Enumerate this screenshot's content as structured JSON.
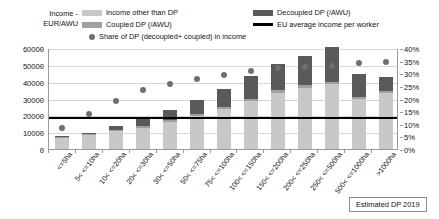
{
  "axis_title": "Income -\nEUR/AWU",
  "axis_title_line1": "Income -",
  "axis_title_line2": "EUR/AWU",
  "legend": {
    "income_other": "Income other than DP",
    "coupled": "Coupled DP (/AWU)",
    "share": "Share of DP (decoupled+ coupled) in income",
    "decoupled": "Decoupled DP (/AWU)",
    "eu_line": "EU average income per worker"
  },
  "colors": {
    "income_other": "#c8c8c8",
    "coupled": "#a0a0a0",
    "decoupled": "#5a5a5a",
    "eu_line": "#000000",
    "dot": "#6f6f6f",
    "grid": "#d6d6d6",
    "axis": "#9a9a9a"
  },
  "note": "Estimated DP 2019",
  "chart_data": {
    "type": "bar",
    "title": "",
    "xlabel": "",
    "ylabel": "Income - EUR/AWU",
    "y2label": "Share of DP in income",
    "ylim": [
      0,
      60000
    ],
    "y2lim": [
      0,
      0.4
    ],
    "grid": true,
    "legend_position": "top",
    "categories": [
      "<=5ha",
      "5< <=10ha",
      "10< <=20ha",
      "20< <=30ha",
      "30< <=50ha",
      "50< <=75ha",
      "75< <=100ha",
      "100< <=150ha",
      "150< <=200ha",
      "200< <=250ha",
      "250< <=500ha",
      "500< <=1000ha",
      ">1000ha"
    ],
    "y_ticks": [
      0,
      10000,
      20000,
      30000,
      40000,
      50000,
      60000
    ],
    "y_tick_labels": [
      "0",
      "10000",
      "20000",
      "30000",
      "40000",
      "50000",
      "60000"
    ],
    "y2_ticks": [
      0,
      5,
      10,
      15,
      20,
      25,
      30,
      35,
      40
    ],
    "y2_tick_labels": [
      "0%",
      "5%",
      "10%",
      "15%",
      "20%",
      "25%",
      "30%",
      "35%",
      "40%"
    ],
    "series": [
      {
        "name": "Income other than DP",
        "type": "bar-stack",
        "color": "#c8c8c8",
        "values": [
          6800,
          8200,
          10500,
          12700,
          16000,
          19500,
          23500,
          28500,
          33500,
          36500,
          38500,
          29500,
          33500
        ]
      },
      {
        "name": "Coupled DP (/AWU)",
        "type": "bar-stack",
        "color": "#a0a0a0",
        "values": [
          400,
          500,
          700,
          900,
          1100,
          1300,
          1400,
          1500,
          1500,
          1500,
          1400,
          1200,
          1000
        ]
      },
      {
        "name": "Decoupled DP (/AWU)",
        "type": "bar-stack",
        "color": "#5a5a5a",
        "values": [
          300,
          1000,
          2300,
          4000,
          6200,
          8500,
          11000,
          13500,
          15500,
          17500,
          20500,
          14000,
          8500
        ]
      }
    ],
    "line_series": [
      {
        "name": "EU average income per worker",
        "type": "hline",
        "color": "#000000",
        "value": 19000
      }
    ],
    "scatter_series": [
      {
        "name": "Share of DP (decoupled+ coupled) in income",
        "type": "scatter",
        "axis": "y2",
        "color": "#6f6f6f",
        "values": [
          10.0,
          15.5,
          20.5,
          25.0,
          27.5,
          29.5,
          31.0,
          32.5,
          33.5,
          34.0,
          34.5,
          35.5,
          36.0
        ]
      }
    ]
  }
}
